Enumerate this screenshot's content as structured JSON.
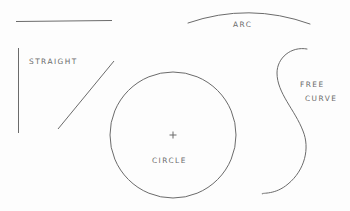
{
  "figure": {
    "background_color": "#fdfdfd",
    "stroke_color": "#6b6b6b",
    "label_color": "#6b6b6b",
    "width": 350,
    "height": 211,
    "labels": {
      "straight": "STRAIGHT",
      "arc": "ARC",
      "circle": "CIRCLE",
      "free": "FREE",
      "curve": "CURVE"
    },
    "shapes": {
      "horizontal_line": {
        "name": "horizontal-straight-line",
        "x1": 16,
        "y1": 21,
        "x2": 112,
        "y2": 20
      },
      "vertical_line": {
        "name": "vertical-straight-line",
        "x1": 18,
        "y1": 48,
        "x2": 18,
        "y2": 133
      },
      "diagonal_line": {
        "name": "diagonal-straight-line",
        "x1": 58,
        "y1": 129,
        "x2": 114,
        "y2": 61
      },
      "arc": {
        "name": "arc-curve",
        "x1": 188,
        "y1": 23,
        "x2": 310,
        "y2": 24,
        "apex_x": 249,
        "apex_y": 10
      },
      "circle": {
        "name": "circle-shape",
        "cx": 173,
        "cy": 135,
        "r": 63
      },
      "center_mark": {
        "name": "circle-center-cross",
        "cx": 173,
        "cy": 135,
        "size": 7
      },
      "free_curve": {
        "name": "free-form-s-curve",
        "start_x": 307,
        "start_y": 49,
        "end_x": 262,
        "end_y": 194
      }
    }
  }
}
